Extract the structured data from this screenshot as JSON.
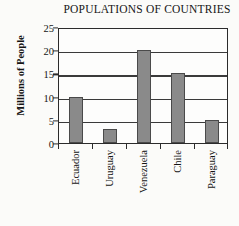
{
  "chart_data": {
    "type": "bar",
    "title": "POPULATIONS OF COUNTRIES",
    "xlabel": "",
    "ylabel": "Millions of People",
    "categories": [
      "Ecuador",
      "Uruguay",
      "Venezuela",
      "Chile",
      "Paraguay"
    ],
    "values": [
      10,
      3,
      20,
      15,
      5
    ],
    "ylim": [
      0,
      25
    ],
    "yticks": [
      0,
      5,
      10,
      15,
      20,
      25
    ],
    "ytick_labels": [
      "0",
      "5",
      "10",
      "15",
      "20",
      "25"
    ],
    "grid": true,
    "grid_axis": "y",
    "legend": false,
    "bar_color": "#8a8a8a",
    "bar_edge_color": "#4a4a4a",
    "axis_color": "#2b2b2b",
    "background_color": "#fbfbf9",
    "text_color": "#151515",
    "xtick_label_rotation": 90
  }
}
